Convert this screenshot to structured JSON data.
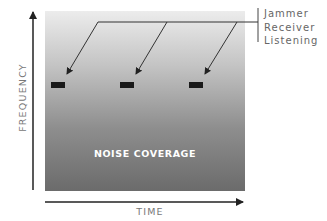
{
  "diagram": {
    "type": "noise-jamming-diagram",
    "y_axis_label": "FREQUENCY",
    "x_axis_label": "TIME",
    "region_label": "NOISE COVERAGE",
    "legend_lines": [
      "Jammer",
      "Receiver",
      "Listening"
    ],
    "jammer_marks_count": 3,
    "colors": {
      "gradient_top": "#ececec",
      "gradient_bottom": "#6b6b6b",
      "marks": "#1a1a1a",
      "axis": "#222222",
      "label_text": "#777777"
    }
  }
}
